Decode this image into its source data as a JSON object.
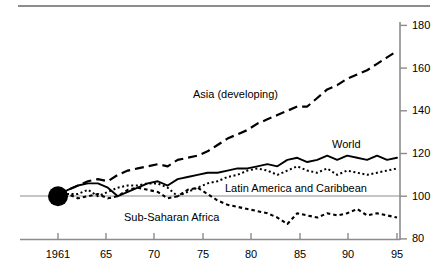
{
  "chart_data": {
    "type": "line",
    "title": "",
    "subtitle": "",
    "xlabel": "",
    "ylabel": "",
    "xlim": [
      1961,
      1995
    ],
    "ylim": [
      80,
      180
    ],
    "grid": false,
    "legend_position": "inline-annotations",
    "x_tick_labels": [
      "1961",
      "65",
      "70",
      "75",
      "80",
      "85",
      "90",
      "95"
    ],
    "x_tick_values": [
      1961,
      1965,
      1970,
      1975,
      1980,
      1985,
      1990,
      1995
    ],
    "y_tick_labels": [
      "80",
      "100",
      "120",
      "140",
      "160",
      "180"
    ],
    "y_tick_values": [
      80,
      100,
      120,
      140,
      160,
      180
    ],
    "baseline_value": 100,
    "origin_marker": {
      "label": "",
      "x": 1961,
      "y": 100,
      "shape": "filled-circle"
    },
    "x": [
      1961,
      1962,
      1963,
      1964,
      1965,
      1966,
      1967,
      1968,
      1969,
      1970,
      1971,
      1972,
      1973,
      1974,
      1975,
      1976,
      1977,
      1978,
      1979,
      1980,
      1981,
      1982,
      1983,
      1984,
      1985,
      1986,
      1987,
      1988,
      1989,
      1990,
      1991,
      1992,
      1993,
      1994,
      1995
    ],
    "series": [
      {
        "name": "Asia (developing)",
        "style": "dashed",
        "values": [
          100,
          103,
          105,
          107,
          108,
          107,
          110,
          112,
          113,
          114,
          115,
          114,
          117,
          118,
          119,
          121,
          124,
          127,
          129,
          131,
          134,
          136,
          138,
          140,
          142,
          142,
          146,
          150,
          152,
          155,
          157,
          159,
          162,
          165,
          168
        ]
      },
      {
        "name": "World",
        "style": "solid",
        "values": [
          100,
          103,
          105,
          106,
          106,
          104,
          100,
          102,
          104,
          106,
          107,
          105,
          108,
          109,
          110,
          111,
          111,
          112,
          113,
          113,
          114,
          115,
          114,
          117,
          118,
          116,
          117,
          119,
          117,
          119,
          118,
          117,
          119,
          117,
          118
        ]
      },
      {
        "name": "Latin America and Caribbean",
        "style": "dotted",
        "values": [
          100,
          101,
          101,
          103,
          100,
          102,
          104,
          105,
          105,
          106,
          106,
          104,
          100,
          102,
          104,
          106,
          107,
          109,
          110,
          112,
          113,
          112,
          110,
          112,
          114,
          112,
          111,
          113,
          110,
          112,
          111,
          110,
          111,
          112,
          113
        ]
      },
      {
        "name": "Sub-Saharan Africa",
        "style": "dotted-coarse",
        "values": [
          100,
          101,
          99,
          100,
          101,
          99,
          100,
          103,
          104,
          103,
          102,
          99,
          100,
          103,
          104,
          101,
          98,
          96,
          95,
          94,
          93,
          92,
          90,
          87,
          92,
          91,
          90,
          92,
          91,
          92,
          94,
          91,
          92,
          91,
          90
        ]
      }
    ],
    "annotations": [
      {
        "text": "Asia (developing)",
        "x_px": 193,
        "y_px": 88
      },
      {
        "text": "World",
        "x_px": 332,
        "y_px": 138
      },
      {
        "text": "Latin America and Caribbean",
        "x_px": 225,
        "y_px": 182
      },
      {
        "text": "Sub-Saharan Africa",
        "x_px": 124,
        "y_px": 211
      }
    ],
    "colors": {
      "line": "#000000",
      "axis": "#8c8c8c",
      "text": "#000000",
      "background": "#ffffff"
    }
  }
}
